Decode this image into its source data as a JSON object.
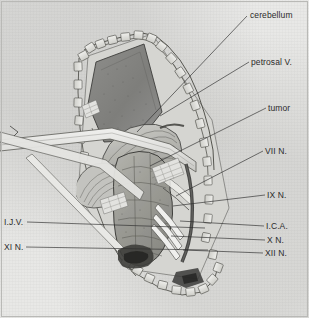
{
  "figure": {
    "kind": "anatomical-illustration",
    "background_color": "#e9e9e7",
    "ink_color": "#2b2b2b"
  },
  "labels": {
    "right": [
      {
        "id": "cerebellum",
        "text": "cerebellum",
        "x": 250,
        "y": 17,
        "leader_to_x": 137,
        "leader_to_y": 132
      },
      {
        "id": "petrosal_v",
        "text": "petrosal V.",
        "x": 251,
        "y": 64,
        "leader_to_x": 160,
        "leader_to_y": 116
      },
      {
        "id": "tumor",
        "text": "tumor",
        "x": 268,
        "y": 110,
        "leader_to_x": 150,
        "leader_to_y": 166
      },
      {
        "id": "vii_n",
        "text": "VII N.",
        "x": 265,
        "y": 153,
        "leader_to_x": 176,
        "leader_to_y": 196
      },
      {
        "id": "ix_n",
        "text": "IX N.",
        "x": 267,
        "y": 196,
        "leader_to_x": 173,
        "leader_to_y": 206
      },
      {
        "id": "ica",
        "text": "I.C.A.",
        "x": 266,
        "y": 228,
        "leader_to_x": 180,
        "leader_to_y": 221
      },
      {
        "id": "x_n",
        "text": "X N.",
        "x": 267,
        "y": 242,
        "leader_to_x": 171,
        "leader_to_y": 236
      },
      {
        "id": "xii_n",
        "text": "XII N.",
        "x": 265,
        "y": 255,
        "leader_to_x": 183,
        "leader_to_y": 250
      }
    ],
    "left": [
      {
        "id": "ijv",
        "text": "I.J.V.",
        "x": 4,
        "y": 219,
        "leader_to_x": 205,
        "leader_to_y": 228
      },
      {
        "id": "xi_n",
        "text": "XI N.",
        "x": 4,
        "y": 244,
        "leader_to_x": 208,
        "leader_to_y": 250
      }
    ]
  }
}
